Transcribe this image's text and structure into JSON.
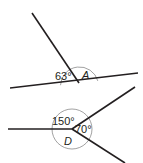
{
  "diagrams": [
    {
      "id": "figure-a",
      "description": "Straight line with a ray meeting it at a point; adjacent angles on a straight line",
      "angles": [
        {
          "label": "63°",
          "known": true
        },
        {
          "label": "A",
          "known": false
        }
      ]
    },
    {
      "id": "figure-d",
      "description": "Three rays meeting at a point; angles around a point",
      "angles": [
        {
          "label": "150°",
          "known": true
        },
        {
          "label": "70°",
          "known": true
        },
        {
          "label": "D",
          "known": false
        }
      ]
    }
  ],
  "colors": {
    "line": "#231f20",
    "arc": "#8a8a8a",
    "background": "#ffffff"
  }
}
